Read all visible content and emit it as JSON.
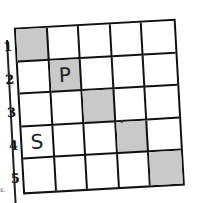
{
  "puzzle": {
    "rows": 5,
    "cols": 5,
    "row_labels": [
      "1",
      "2",
      "3",
      "4",
      "5"
    ],
    "cells": [
      [
        {
          "shaded": true,
          "letter": ""
        },
        {
          "shaded": false,
          "letter": ""
        },
        {
          "shaded": false,
          "letter": ""
        },
        {
          "shaded": false,
          "letter": ""
        },
        {
          "shaded": false,
          "letter": ""
        }
      ],
      [
        {
          "shaded": false,
          "letter": ""
        },
        {
          "shaded": true,
          "letter": "P"
        },
        {
          "shaded": false,
          "letter": ""
        },
        {
          "shaded": false,
          "letter": ""
        },
        {
          "shaded": false,
          "letter": ""
        }
      ],
      [
        {
          "shaded": false,
          "letter": ""
        },
        {
          "shaded": false,
          "letter": ""
        },
        {
          "shaded": true,
          "letter": ""
        },
        {
          "shaded": false,
          "letter": ""
        },
        {
          "shaded": false,
          "letter": ""
        }
      ],
      [
        {
          "shaded": false,
          "letter": "S"
        },
        {
          "shaded": false,
          "letter": ""
        },
        {
          "shaded": false,
          "letter": ""
        },
        {
          "shaded": true,
          "letter": ""
        },
        {
          "shaded": false,
          "letter": ""
        }
      ],
      [
        {
          "shaded": false,
          "letter": ""
        },
        {
          "shaded": false,
          "letter": ""
        },
        {
          "shaded": false,
          "letter": ""
        },
        {
          "shaded": false,
          "letter": ""
        },
        {
          "shaded": true,
          "letter": ""
        }
      ]
    ],
    "colors": {
      "grid_line": "#111111",
      "shade": "#c9c9c9",
      "background": "#ffffff"
    }
  },
  "stray_mark": "s."
}
